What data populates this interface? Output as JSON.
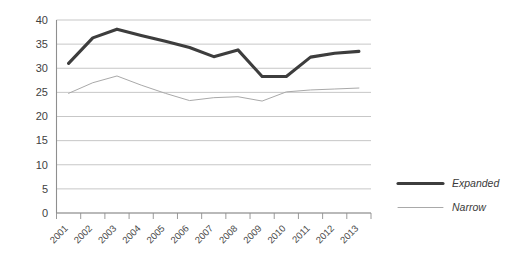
{
  "chart_data": {
    "type": "line",
    "title": "",
    "subtitle": "",
    "xlabel": "",
    "ylabel": "",
    "categories": [
      "2001",
      "2002",
      "2003",
      "2004",
      "2005",
      "2006",
      "2007",
      "2008",
      "2009",
      "2010",
      "2011",
      "2012",
      "2013"
    ],
    "series": [
      {
        "name": "Expanded",
        "color": "#3d3d3d",
        "line_width": "thick",
        "values": [
          31.0,
          36.3,
          38.1,
          36.8,
          35.6,
          34.3,
          32.4,
          33.8,
          28.3,
          28.3,
          32.3,
          33.1,
          33.5
        ]
      },
      {
        "name": "Narrow",
        "color": "#a9a9a9",
        "line_width": "thin",
        "values": [
          24.8,
          27.0,
          28.4,
          26.5,
          24.8,
          23.3,
          23.9,
          24.1,
          23.2,
          25.1,
          25.5,
          25.7,
          25.9
        ]
      }
    ],
    "ylim": [
      0,
      40
    ],
    "yticks": [
      0,
      5,
      10,
      15,
      20,
      25,
      30,
      35,
      40
    ],
    "ytick_labels": [
      "0",
      "5",
      "10",
      "15",
      "20",
      "25",
      "30",
      "35",
      "40"
    ],
    "grid": true,
    "grid_axis": "y",
    "legend_position": "right",
    "xtick_rotation": -45
  },
  "legend": {
    "entries": [
      {
        "label": "Expanded"
      },
      {
        "label": "Narrow"
      }
    ]
  }
}
